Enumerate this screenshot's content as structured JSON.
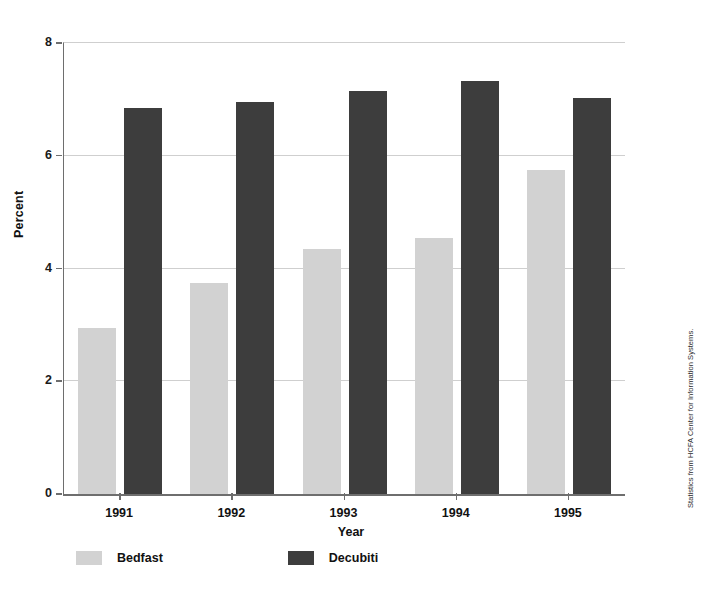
{
  "chart_data": {
    "type": "bar",
    "title": "",
    "xlabel": "Year",
    "ylabel": "Percent",
    "categories": [
      "1991",
      "1992",
      "1993",
      "1994",
      "1995"
    ],
    "series": [
      {
        "name": "Bedfast",
        "color": "#d2d2d2",
        "values": [
          2.95,
          3.75,
          4.35,
          4.55,
          5.75
        ]
      },
      {
        "name": "Decubiti",
        "color": "#3d3d3d",
        "values": [
          6.85,
          6.95,
          7.15,
          7.33,
          7.02
        ]
      }
    ],
    "ylim": [
      0,
      8
    ],
    "yticks": [
      0,
      2,
      4,
      6,
      8
    ],
    "ytick_labels": [
      "0",
      "2",
      "4",
      "6",
      "8"
    ],
    "grid": true,
    "legend_position": "bottom-left",
    "annotations": [
      "Statistics from HCFA Center for Information Systems."
    ]
  },
  "source_note": "Statistics from HCFA Center for Information Systems."
}
